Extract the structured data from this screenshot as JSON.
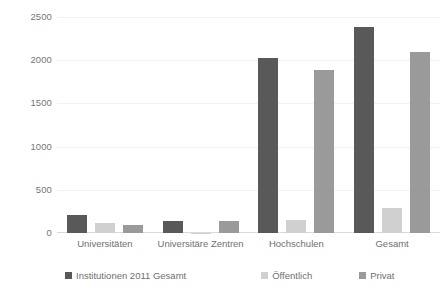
{
  "chart_data": {
    "type": "bar",
    "title": "",
    "subtitle": "",
    "xlabel": "",
    "ylabel": "",
    "ylim": [
      0,
      2500
    ],
    "yticks": [
      0,
      500,
      1000,
      1500,
      2000,
      2500
    ],
    "ytick_labels": [
      "0",
      "500",
      "1000",
      "1500",
      "2000",
      "2500"
    ],
    "grid": true,
    "grid_axis": "y",
    "legend_position": "bottom",
    "categories": [
      "Universitäten",
      "Universitäre Zentren",
      "Hochschulen",
      "Gesamt"
    ],
    "series": [
      {
        "name": "Institutionen 2011 Gesamt",
        "color": "#595959",
        "values": [
          210,
          140,
          2030,
          2380
        ]
      },
      {
        "name": "Öffentlich",
        "color": "#d0d0d0",
        "values": [
          115,
          3,
          150,
          290
        ]
      },
      {
        "name": "Privat",
        "color": "#9a9a9a",
        "values": [
          95,
          140,
          1890,
          2100
        ]
      }
    ]
  },
  "axis": {
    "y_ticks": [
      {
        "label": "2500",
        "value": 2500
      },
      {
        "label": "2000",
        "value": 2000
      },
      {
        "label": "1500",
        "value": 1500
      },
      {
        "label": "1000",
        "value": 1000
      },
      {
        "label": "500",
        "value": 500
      },
      {
        "label": "0",
        "value": 0
      }
    ],
    "x_labels": [
      "Universitäten",
      "Universitäre Zentren",
      "Hochschulen",
      "Gesamt"
    ]
  },
  "legend": {
    "items": [
      {
        "label": "Institutionen 2011 Gesamt",
        "color": "#595959"
      },
      {
        "label": "Öffentlich",
        "color": "#d0d0d0"
      },
      {
        "label": "Privat",
        "color": "#9a9a9a"
      }
    ]
  },
  "colors": {
    "series_dark": "#595959",
    "series_light": "#d0d0d0",
    "series_medium": "#9a9a9a",
    "gridline": "#f2f2f2",
    "axis": "#d9d9d9",
    "text": "#6f6f6f",
    "background": "#ffffff"
  }
}
